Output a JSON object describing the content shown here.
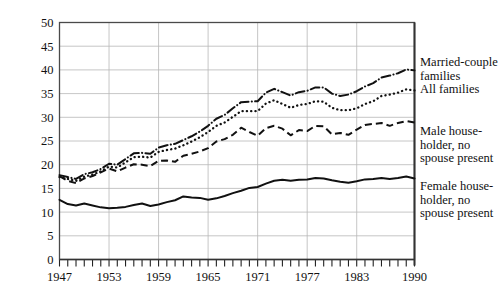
{
  "chart_data": {
    "type": "line",
    "title": "",
    "subtitle": "",
    "xlabel": "",
    "ylabel": "Thousands of 1990 Dollars",
    "xlim": [
      1947,
      1990
    ],
    "ylim": [
      0,
      50
    ],
    "grid": true,
    "legend_position": "right-outside-inline",
    "ytick_labels": [
      "0",
      "5",
      "10",
      "15",
      "20",
      "25",
      "30",
      "35",
      "40",
      "45",
      "50"
    ],
    "ytick_values": [
      0,
      5,
      10,
      15,
      20,
      25,
      30,
      35,
      40,
      45,
      50
    ],
    "xtick_labels": [
      "1947",
      "1953",
      "1959",
      "1965",
      "1971",
      "1977",
      "1983",
      "1990"
    ],
    "xtick_values": [
      1947,
      1953,
      1959,
      1965,
      1971,
      1977,
      1983,
      1990
    ],
    "x_minor_ticks_every": 1,
    "x": [
      1947,
      1948,
      1949,
      1950,
      1951,
      1952,
      1953,
      1954,
      1955,
      1956,
      1957,
      1958,
      1959,
      1960,
      1961,
      1962,
      1963,
      1964,
      1965,
      1966,
      1967,
      1968,
      1969,
      1970,
      1971,
      1972,
      1973,
      1974,
      1975,
      1976,
      1977,
      1978,
      1979,
      1980,
      1981,
      1982,
      1983,
      1984,
      1985,
      1986,
      1987,
      1988,
      1989,
      1990
    ],
    "series": [
      {
        "name": "Married-couple families",
        "style": "dash-dot",
        "color": "#111111",
        "values": [
          17.8,
          17.4,
          17.0,
          18.0,
          18.4,
          19.1,
          20.2,
          20.0,
          21.2,
          22.4,
          22.5,
          22.3,
          23.6,
          24.1,
          24.4,
          25.2,
          26.0,
          27.0,
          28.2,
          29.7,
          30.5,
          31.9,
          33.2,
          33.3,
          33.4,
          35.2,
          36.0,
          35.3,
          34.6,
          35.3,
          35.6,
          36.3,
          36.3,
          35.0,
          34.5,
          34.8,
          35.5,
          36.5,
          37.2,
          38.4,
          38.8,
          39.3,
          40.1,
          39.9
        ]
      },
      {
        "name": "All families",
        "style": "dotted",
        "color": "#111111",
        "values": [
          17.4,
          17.0,
          16.6,
          17.5,
          17.9,
          18.6,
          19.6,
          19.4,
          20.5,
          21.6,
          21.7,
          21.5,
          22.7,
          23.1,
          23.4,
          24.1,
          24.9,
          25.8,
          26.9,
          28.2,
          28.9,
          30.1,
          31.3,
          31.3,
          31.3,
          32.9,
          33.6,
          32.8,
          32.0,
          32.6,
          32.8,
          33.4,
          33.3,
          32.0,
          31.5,
          31.5,
          31.9,
          32.8,
          33.4,
          34.5,
          34.8,
          35.2,
          35.9,
          35.7
        ]
      },
      {
        "name": "Male householder, no spouse present",
        "style": "dashed",
        "color": "#111111",
        "values": [
          17.6,
          16.6,
          16.1,
          17.1,
          17.6,
          18.4,
          19.2,
          18.6,
          19.4,
          20.1,
          20.0,
          19.7,
          20.8,
          20.9,
          20.6,
          21.9,
          22.3,
          22.8,
          23.5,
          24.9,
          25.4,
          26.3,
          27.8,
          26.9,
          26.1,
          27.7,
          28.2,
          27.6,
          26.2,
          27.3,
          27.1,
          28.2,
          28.1,
          26.4,
          26.7,
          26.3,
          27.4,
          28.4,
          28.6,
          28.8,
          28.2,
          28.8,
          29.2,
          28.9
        ]
      },
      {
        "name": "Female householder, no spouse present",
        "style": "solid",
        "color": "#111111",
        "values": [
          12.6,
          11.7,
          11.4,
          11.8,
          11.4,
          11.0,
          10.8,
          10.9,
          11.1,
          11.5,
          11.8,
          11.3,
          11.6,
          12.1,
          12.5,
          13.3,
          13.1,
          13.0,
          12.6,
          12.9,
          13.4,
          14.0,
          14.5,
          15.1,
          15.3,
          16.0,
          16.6,
          16.8,
          16.6,
          16.8,
          16.9,
          17.2,
          17.1,
          16.7,
          16.4,
          16.2,
          16.5,
          16.9,
          17.0,
          17.2,
          17.0,
          17.2,
          17.5,
          17.1
        ]
      }
    ],
    "legend_labels": [
      "Married-couple\nfamilies",
      "All families",
      "Male house-\nholder, no\nspouse present",
      "Female house-\nholder, no\nspouse present"
    ]
  }
}
